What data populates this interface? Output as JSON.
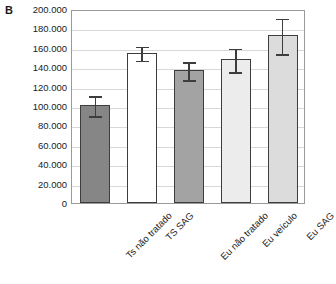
{
  "panel": {
    "label": "B"
  },
  "chart_data": {
    "type": "bar",
    "title": "",
    "subtitle": "",
    "xlabel": "",
    "ylabel": "",
    "grid": true,
    "legend": "none",
    "ylim": [
      0,
      200000
    ],
    "ytick_step": 20000,
    "ytick_labels": [
      "200.000",
      "180.000",
      "160.000",
      "140.000",
      "120.000",
      "100.000",
      "80.000",
      "60.000",
      "40.000",
      "20.000",
      "0"
    ],
    "ytick_values": [
      200000,
      180000,
      160000,
      140000,
      120000,
      100000,
      80000,
      60000,
      40000,
      20000,
      0
    ],
    "categories": [
      "Ts não tratado",
      "TS SAG",
      "Eu não tratado",
      "Eu veículo",
      "Eu SAG"
    ],
    "values": [
      101000,
      155000,
      137000,
      148000,
      173000
    ],
    "errors": [
      11000,
      8000,
      10000,
      13000,
      19000
    ],
    "bar_colors": [
      "#868686",
      "#ffffff",
      "#a3a3a3",
      "#ececec",
      "#dcdcdc"
    ],
    "bar_edge_color": "#3d3d3d",
    "error_bar_color": "#3d3d3d",
    "gridline_color": "#d8d8d8",
    "frame_color": "#9a9a9a"
  }
}
